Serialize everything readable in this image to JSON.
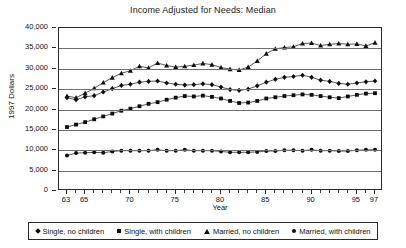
{
  "chart_data": {
    "type": "line",
    "title": "Income Adjusted for Needs: Median",
    "xlabel": "Year",
    "ylabel": "1997 Dollars",
    "ylim": [
      0,
      40000
    ],
    "ytick_labels": [
      "40,000",
      "35,000",
      "30,000",
      "25,000",
      "20,000",
      "15,000",
      "10,000",
      "5,000",
      "0"
    ],
    "ytick_values": [
      40000,
      35000,
      30000,
      25000,
      20000,
      15000,
      10000,
      5000,
      0
    ],
    "grid": true,
    "legend_position": "bottom",
    "xlim": [
      63,
      97
    ],
    "x": [
      63,
      64,
      65,
      66,
      67,
      68,
      69,
      70,
      71,
      72,
      73,
      74,
      75,
      76,
      77,
      78,
      79,
      80,
      81,
      82,
      83,
      84,
      85,
      86,
      87,
      88,
      89,
      90,
      91,
      92,
      93,
      94,
      95,
      96,
      97
    ],
    "xtick_labels": [
      "63",
      "65",
      "70",
      "75",
      "80",
      "85",
      "90",
      "95",
      "97"
    ],
    "xtick_values": [
      63,
      65,
      70,
      75,
      80,
      85,
      90,
      95,
      97
    ],
    "series": [
      {
        "name": "Single, no children",
        "marker": "diamond",
        "values": [
          22900,
          22400,
          23100,
          23400,
          24300,
          25100,
          25900,
          26200,
          26700,
          26900,
          27000,
          26500,
          26200,
          26000,
          26100,
          26300,
          26100,
          25500,
          24900,
          24700,
          25000,
          25800,
          26700,
          27400,
          27900,
          28100,
          28400,
          27900,
          27200,
          26900,
          26400,
          26200,
          26500,
          26800,
          27000
        ]
      },
      {
        "name": "Single, with children",
        "marker": "square",
        "values": [
          15700,
          16300,
          16900,
          17600,
          18300,
          19000,
          19700,
          20200,
          20800,
          21400,
          21800,
          22400,
          22900,
          23300,
          23200,
          23400,
          23100,
          22700,
          22100,
          21600,
          21700,
          22100,
          22700,
          23000,
          23300,
          23500,
          23700,
          23600,
          23300,
          23000,
          22800,
          23200,
          23600,
          23900,
          24000
        ]
      },
      {
        "name": "Married, no children",
        "marker": "triangle",
        "values": [
          23300,
          22900,
          24000,
          25200,
          26600,
          27800,
          28900,
          29500,
          30600,
          30200,
          31400,
          30800,
          30400,
          30600,
          30900,
          31300,
          31000,
          30300,
          29900,
          29700,
          30400,
          31900,
          33700,
          34900,
          35200,
          35400,
          36200,
          36300,
          35700,
          36000,
          36200,
          36000,
          36100,
          35600,
          36400
        ]
      },
      {
        "name": "Married, with children",
        "marker": "circle",
        "values": [
          8700,
          9300,
          9400,
          9500,
          9400,
          9700,
          9900,
          9900,
          9900,
          9900,
          10100,
          9900,
          9900,
          10100,
          9900,
          9900,
          9900,
          9700,
          9500,
          9500,
          9500,
          9600,
          9800,
          9800,
          10000,
          10000,
          9900,
          10100,
          9900,
          9900,
          9800,
          9800,
          10000,
          10100,
          10100
        ]
      }
    ]
  }
}
